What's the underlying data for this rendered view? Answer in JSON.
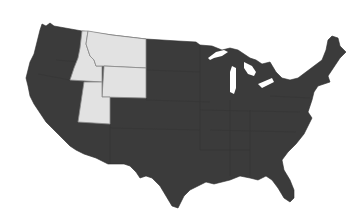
{
  "map": {
    "type": "choropleth",
    "region": "Contiguous United States",
    "colors": {
      "default_fill": "#3b3b3b",
      "highlight_fill": "#e2e2e2",
      "highlight_border": "#8a8a8a",
      "background": "#ffffff"
    },
    "highlighted_states": [
      "Montana",
      "Idaho",
      "Wyoming",
      "Utah"
    ],
    "caption": ""
  }
}
